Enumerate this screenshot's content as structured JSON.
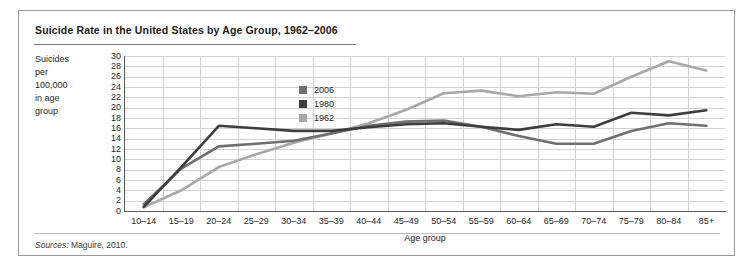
{
  "figure": {
    "title": "Suicide Rate in the United States by Age Group, 1962–2006",
    "sources_label": "Sources:",
    "sources_text": " Maguire, 2010."
  },
  "axis": {
    "y_caption_lines": [
      "Suicides",
      "per",
      "100,000",
      "in age",
      "group"
    ],
    "x_title": "Age group",
    "y_ticks": [
      30,
      28,
      26,
      24,
      22,
      20,
      18,
      16,
      14,
      12,
      10,
      8,
      6,
      4,
      2,
      0
    ]
  },
  "legend": {
    "position": "inside-upper-center",
    "entries": [
      {
        "label": "2006",
        "color": "#6f6f6f"
      },
      {
        "label": "1980",
        "color": "#3d3d3d"
      },
      {
        "label": "1962",
        "color": "#a8a8a8"
      }
    ]
  },
  "chart_data": {
    "type": "line",
    "title": "Suicide Rate in the United States by Age Group, 1962–2006",
    "xlabel": "Age group",
    "ylabel": "Suicides per 100,000 in age group",
    "ylim": [
      0,
      30
    ],
    "ytick_step": 2,
    "grid": true,
    "categories": [
      "10–14",
      "15–19",
      "20–24",
      "25–29",
      "30–34",
      "35–39",
      "40–44",
      "45–49",
      "50–54",
      "55–59",
      "60–64",
      "65–69",
      "70–74",
      "75–79",
      "80–84",
      "85+"
    ],
    "series": [
      {
        "name": "2006",
        "color": "#6f6f6f",
        "values": [
          1.3,
          8.2,
          12.5,
          13.0,
          13.6,
          15.0,
          16.5,
          17.3,
          17.5,
          16.3,
          14.5,
          13.0,
          13.0,
          15.5,
          17.0,
          16.5
        ]
      },
      {
        "name": "1980",
        "color": "#3d3d3d",
        "values": [
          0.8,
          8.5,
          16.5,
          16.0,
          15.5,
          15.5,
          16.2,
          16.8,
          17.0,
          16.3,
          15.7,
          16.8,
          16.3,
          19.0,
          18.5,
          19.5
        ]
      },
      {
        "name": "1962",
        "color": "#a8a8a8",
        "values": [
          0.7,
          4.0,
          8.5,
          11.0,
          13.2,
          15.0,
          17.0,
          19.6,
          22.8,
          23.3,
          22.2,
          23.0,
          22.7,
          26.0,
          29.0,
          27.2
        ]
      }
    ],
    "source": "Maguire, 2010."
  }
}
